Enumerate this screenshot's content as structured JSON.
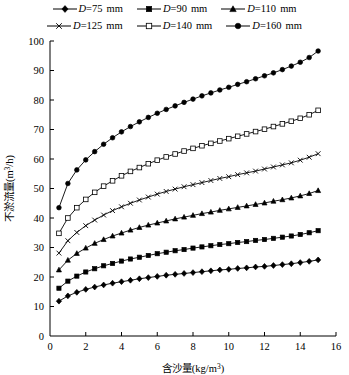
{
  "chart_data": {
    "type": "line",
    "title": "",
    "xlabel": "含沙量(kg/m³)",
    "ylabel": "不淤流量(m³/h)",
    "xlim": [
      0,
      16
    ],
    "ylim": [
      0,
      100
    ],
    "xticks": [
      0,
      2,
      4,
      6,
      8,
      10,
      12,
      14,
      16
    ],
    "yticks": [
      0,
      10,
      20,
      30,
      40,
      50,
      60,
      70,
      80,
      90,
      100
    ],
    "grid": false,
    "legend_position": "top",
    "x": [
      0.5,
      1,
      1.5,
      2,
      2.5,
      3,
      3.5,
      4,
      4.5,
      5,
      5.5,
      6,
      6.5,
      7,
      7.5,
      8,
      8.5,
      9,
      9.5,
      10,
      10.5,
      11,
      11.5,
      12,
      12.5,
      13,
      13.5,
      14,
      14.5,
      15
    ],
    "series": [
      {
        "name": "D=75 mm",
        "marker": "filled-diamond",
        "values": [
          11.8,
          13.6,
          14.8,
          15.8,
          16.6,
          17.3,
          17.9,
          18.4,
          18.9,
          19.4,
          19.8,
          20.2,
          20.6,
          20.9,
          21.2,
          21.5,
          21.8,
          22.1,
          22.4,
          22.6,
          22.9,
          23.1,
          23.4,
          23.6,
          23.9,
          24.2,
          24.5,
          24.9,
          25.3,
          25.8
        ]
      },
      {
        "name": "D=90 mm",
        "marker": "filled-square",
        "values": [
          16.2,
          18.6,
          20.3,
          21.7,
          22.8,
          23.8,
          24.6,
          25.4,
          26.1,
          26.7,
          27.3,
          27.9,
          28.4,
          28.9,
          29.3,
          29.8,
          30.2,
          30.6,
          31.0,
          31.3,
          31.7,
          32.0,
          32.4,
          32.7,
          33.1,
          33.5,
          33.9,
          34.4,
          35.0,
          35.7
        ]
      },
      {
        "name": "D=110 mm",
        "marker": "filled-triangle",
        "values": [
          22.4,
          25.7,
          28.0,
          29.8,
          31.4,
          32.7,
          33.9,
          34.9,
          35.9,
          36.8,
          37.6,
          38.3,
          39.0,
          39.7,
          40.3,
          40.9,
          41.5,
          42.0,
          42.6,
          43.1,
          43.6,
          44.1,
          44.6,
          45.1,
          45.7,
          46.2,
          46.8,
          47.5,
          48.3,
          49.3
        ]
      },
      {
        "name": "D=125 mm",
        "marker": "cross",
        "values": [
          28.1,
          32.3,
          35.1,
          37.4,
          39.3,
          41.0,
          42.5,
          43.8,
          45.0,
          46.1,
          47.1,
          48.1,
          49.0,
          49.8,
          50.6,
          51.3,
          52.0,
          52.7,
          53.4,
          54.0,
          54.7,
          55.3,
          55.9,
          56.6,
          57.3,
          58.0,
          58.7,
          59.6,
          60.6,
          61.8
        ]
      },
      {
        "name": "D=140 mm",
        "marker": "open-square",
        "values": [
          34.8,
          40.0,
          43.5,
          46.3,
          48.7,
          50.8,
          52.6,
          54.3,
          55.8,
          57.1,
          58.4,
          59.6,
          60.7,
          61.7,
          62.7,
          63.6,
          64.5,
          65.3,
          66.1,
          66.9,
          67.7,
          68.5,
          69.3,
          70.1,
          71.0,
          71.9,
          72.8,
          73.8,
          75.0,
          76.5
        ]
      },
      {
        "name": "D=160 mm",
        "marker": "filled-circle",
        "values": [
          43.5,
          51.7,
          56.3,
          59.7,
          62.5,
          65.0,
          67.2,
          69.2,
          71.0,
          72.6,
          74.1,
          75.5,
          76.8,
          78.0,
          79.2,
          80.3,
          81.4,
          82.4,
          83.4,
          84.3,
          85.3,
          86.2,
          87.2,
          88.2,
          89.2,
          90.3,
          91.5,
          92.8,
          94.4,
          96.6
        ]
      }
    ]
  },
  "legend": {
    "rows": [
      [
        {
          "label_var": "D",
          "label_rest": "=75",
          "units": "mm",
          "marker": "filled-diamond"
        },
        {
          "label_var": "D",
          "label_rest": "=90",
          "units": "mm",
          "marker": "filled-square"
        },
        {
          "label_var": "D",
          "label_rest": "=110",
          "units": "mm",
          "marker": "filled-triangle"
        }
      ],
      [
        {
          "label_var": "D",
          "label_rest": "=125",
          "units": "mm",
          "marker": "cross"
        },
        {
          "label_var": "D",
          "label_rest": "=140",
          "units": "mm",
          "marker": "open-square"
        },
        {
          "label_var": "D",
          "label_rest": "=160",
          "units": "mm",
          "marker": "filled-circle"
        }
      ]
    ]
  },
  "axes": {
    "y_title_main": "不淤流量(m",
    "y_title_sup": "3",
    "y_title_tail": "/h)",
    "x_title_main": "含沙量(kg/m",
    "x_title_sup": "3",
    "x_title_tail": ")"
  },
  "colors": {
    "line": "#000000",
    "background": "#ffffff",
    "text": "#000000"
  }
}
